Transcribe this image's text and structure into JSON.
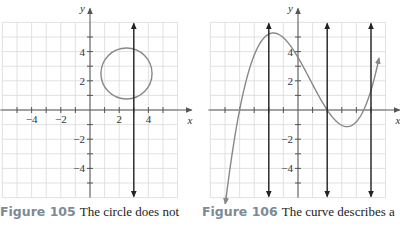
{
  "figures": [
    {
      "id": "fig105",
      "caption_label": "Figure 105",
      "caption_text": "The circle does not describe a function.",
      "caption_visible": "The circle does not"
    },
    {
      "id": "fig106",
      "caption_label": "Figure 106",
      "caption_text": "The curve describes a function.",
      "caption_visible": "The curve describes a"
    }
  ],
  "colors": {
    "grid": "#d9d9d9",
    "axis": "#555555",
    "curve": "#888888",
    "vertical_lines": "#222222",
    "caption_label": "#7d8a96"
  },
  "chart_data": [
    {
      "type": "line",
      "title": "Figure 105 The circle does not describe a function",
      "xlabel": "x",
      "ylabel": "y",
      "xlim": [
        -6,
        6
      ],
      "ylim": [
        -6,
        6
      ],
      "grid": true,
      "x_tick_labels": [
        "-4",
        "-2",
        "2",
        "4"
      ],
      "y_tick_labels": [
        "4",
        "2",
        "-2",
        "-4"
      ],
      "series": [
        {
          "name": "circle",
          "shape": "circle",
          "center": [
            2.5,
            2.5
          ],
          "radius": 1.75
        }
      ],
      "vertical_line_test": [
        3
      ]
    },
    {
      "type": "line",
      "title": "Figure 106 The curve describes a function",
      "xlabel": "x",
      "ylabel": "y",
      "xlim": [
        -6,
        6
      ],
      "ylim": [
        -6,
        6
      ],
      "grid": true,
      "x_tick_labels": [],
      "y_tick_labels": [
        "4",
        "2",
        "-2",
        "-4"
      ],
      "series": [
        {
          "name": "cubic curve",
          "formula": "0.1*(x+4)*(x-2)*(x-4.5)",
          "x_range": [
            -5,
            6
          ],
          "points": [
            [
              -5,
              -4.6
            ],
            [
              -4,
              0
            ],
            [
              -1.5,
              5.25
            ],
            [
              0,
              3.6
            ],
            [
              2,
              0
            ],
            [
              3.3,
              -1.14
            ],
            [
              4.5,
              0
            ],
            [
              5.5,
              2.6
            ]
          ]
        }
      ],
      "vertical_line_test": [
        -2,
        2,
        5
      ]
    }
  ]
}
